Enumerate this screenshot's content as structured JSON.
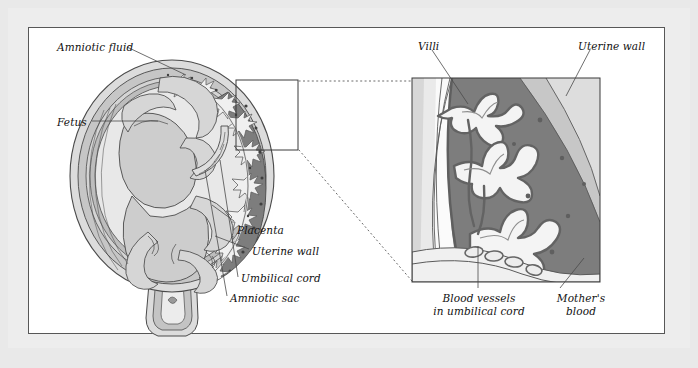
{
  "figure": {
    "kind": "anatomical-diagram",
    "background_color": "#e9e9e9",
    "plate_color": "#ffffff",
    "border_color": "#575757"
  },
  "palette": {
    "uterine_wall": "#c9c9c9",
    "uterine_wall_outer": "#dcdcdc",
    "amniotic_sac": "#bdbdbd",
    "amniotic_fluid": "#e6e6e6",
    "fetus": "#cfcfcf",
    "placenta_dark": "#7d7d7d",
    "mothers_blood": "#7d7d7d",
    "villi_fill": "#f2f2f2",
    "villi_stroke": "#6e6e6e",
    "outline": "#4a4a4a",
    "leader_line": "#4a4a4a",
    "dotted_connector": "#6a6a6a"
  },
  "main_diagram": {
    "name": "uterus-cross-section",
    "labels": [
      {
        "id": "amniotic-fluid",
        "text": "Amniotic fluid",
        "x": 57,
        "y": 41,
        "align": "left"
      },
      {
        "id": "fetus",
        "text": "Fetus",
        "x": 57,
        "y": 116,
        "align": "left"
      },
      {
        "id": "placenta",
        "text": "Placenta",
        "x": 237,
        "y": 224,
        "align": "left"
      },
      {
        "id": "uterine-wall",
        "text": "Uterine wall",
        "x": 252,
        "y": 253,
        "align": "left"
      },
      {
        "id": "umbilical-cord",
        "text": "Umbilical cord",
        "x": 241,
        "y": 281,
        "align": "left"
      },
      {
        "id": "amniotic-sac",
        "text": "Amniotic sac",
        "x": 230,
        "y": 300,
        "align": "left"
      }
    ],
    "callout_box": {
      "x": 236,
      "y": 80,
      "width": 62,
      "height": 70
    }
  },
  "inset_diagram": {
    "name": "villi-magnified-inset",
    "box": {
      "x": 412,
      "y": 78,
      "width": 188,
      "height": 204
    },
    "labels": [
      {
        "id": "villi",
        "text": "Villi",
        "x": 418,
        "y": 40,
        "align": "left"
      },
      {
        "id": "uterine-wall-inset",
        "text": "Uterine wall",
        "x": 578,
        "y": 40,
        "align": "left"
      },
      {
        "id": "blood-vessels",
        "text": "Blood vessels\nin umbilical cord",
        "line1": "Blood vessels",
        "line2": "in umbilical cord",
        "x": 430,
        "y": 292,
        "align": "center"
      },
      {
        "id": "mothers-blood",
        "text": "Mother's\nblood",
        "line1": "Mother's",
        "line2": "blood",
        "x": 556,
        "y": 292,
        "align": "center"
      }
    ]
  },
  "connectors": [
    {
      "id": "connector-top",
      "from": [
        299,
        81
      ],
      "to": [
        412,
        81
      ],
      "style": "dotted"
    },
    {
      "id": "connector-bottom",
      "from": [
        299,
        150
      ],
      "to": [
        412,
        281
      ],
      "style": "dotted"
    }
  ]
}
